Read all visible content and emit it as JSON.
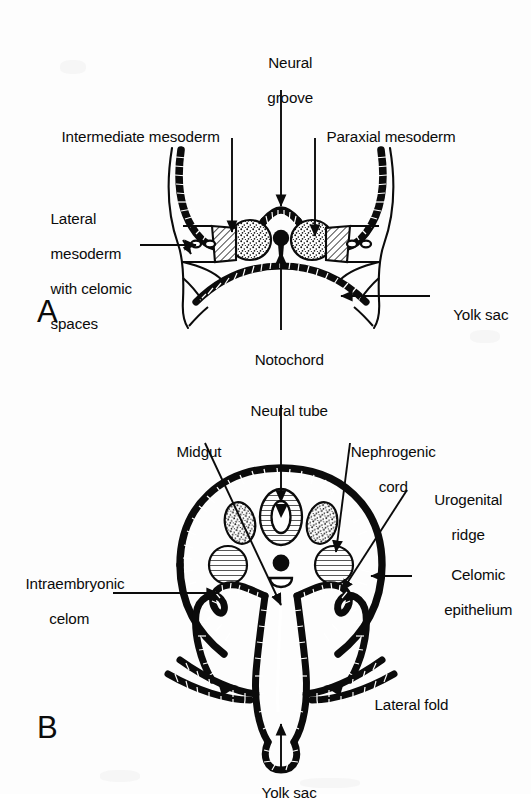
{
  "figure": {
    "background_color": "#fdfdfd",
    "ink_color": "#0b0b0b"
  },
  "panels": [
    {
      "id": "A",
      "letter": "A",
      "stage": "Presomite / neural groove stage",
      "labels": [
        {
          "name": "neural-groove",
          "text": "Neural\ngroove",
          "lines": [
            "Neural",
            "groove"
          ]
        },
        {
          "name": "intermediate-mesoderm",
          "text": "Intermediate mesoderm",
          "lines": [
            "Intermediate mesoderm"
          ]
        },
        {
          "name": "paraxial-mesoderm",
          "text": "Paraxial mesoderm",
          "lines": [
            "Paraxial mesoderm"
          ]
        },
        {
          "name": "lateral-mesoderm",
          "text": "Lateral\nmesoderm\nwith celomic\nspaces",
          "lines": [
            "Lateral",
            "mesoderm",
            "with celomic",
            "spaces"
          ]
        },
        {
          "name": "yolk-sac",
          "text": "Yolk sac",
          "lines": [
            "Yolk sac"
          ]
        },
        {
          "name": "notochord",
          "text": "Notochord",
          "lines": [
            "Notochord"
          ]
        }
      ]
    },
    {
      "id": "B",
      "letter": "B",
      "stage": "Later stage — lateral folds, closed neural tube",
      "labels": [
        {
          "name": "neural-tube",
          "text": "Neural tube",
          "lines": [
            "Neural tube"
          ]
        },
        {
          "name": "midgut",
          "text": "Midgut",
          "lines": [
            "Midgut"
          ]
        },
        {
          "name": "nephrogenic-cord",
          "text": "Nephrogenic\ncord",
          "lines": [
            "Nephrogenic",
            "cord"
          ]
        },
        {
          "name": "urogenital-ridge",
          "text": "Urogenital\nridge",
          "lines": [
            "Urogenital",
            "ridge"
          ]
        },
        {
          "name": "celomic-epithelium",
          "text": "Celomic\nepithelium",
          "lines": [
            "Celomic",
            "epithelium"
          ]
        },
        {
          "name": "intraembryonic-celom",
          "text": "Intraembryonic\ncelom",
          "lines": [
            "Intraembryonic",
            "celom"
          ]
        },
        {
          "name": "lateral-fold",
          "text": "Lateral fold",
          "lines": [
            "Lateral fold"
          ]
        },
        {
          "name": "yolk-sac",
          "text": "Yolk sac",
          "lines": [
            "Yolk sac"
          ]
        }
      ]
    }
  ],
  "labels_a": {
    "neural_groove_l1": "Neural",
    "neural_groove_l2": "groove",
    "intermediate_mesoderm": "Intermediate mesoderm",
    "paraxial_mesoderm": "Paraxial mesoderm",
    "lateral_mesoderm_l1": "Lateral",
    "lateral_mesoderm_l2": "mesoderm",
    "lateral_mesoderm_l3": "with celomic",
    "lateral_mesoderm_l4": "spaces",
    "yolk_sac": "Yolk sac",
    "notochord": "Notochord",
    "panel_letter": "A"
  },
  "labels_b": {
    "neural_tube": "Neural tube",
    "midgut": "Midgut",
    "nephrogenic_cord_l1": "Nephrogenic",
    "nephrogenic_cord_l2": "cord",
    "urogenital_ridge_l1": "Urogenital",
    "urogenital_ridge_l2": "ridge",
    "celomic_epithelium_l1": "Celomic",
    "celomic_epithelium_l2": "epithelium",
    "intraembryonic_celom_l1": "Intraembryonic",
    "intraembryonic_celom_l2": "celom",
    "lateral_fold": "Lateral fold",
    "yolk_sac": "Yolk sac",
    "panel_letter": "B"
  }
}
